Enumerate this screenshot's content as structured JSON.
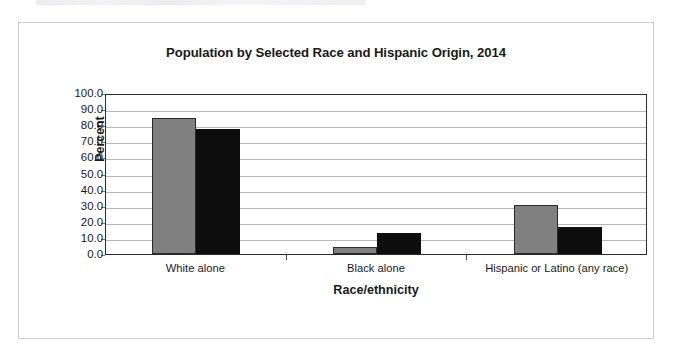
{
  "chart_data": {
    "type": "bar",
    "title": "Population by Selected Race and Hispanic Origin, 2014",
    "xlabel": "Race/ethnicity",
    "ylabel": "Percent",
    "categories": [
      "White alone",
      "Black alone",
      "Hispanic or Latino (any race)"
    ],
    "series": [
      {
        "name": "Arizona",
        "color": "#808080",
        "values": [
          84.5,
          4.5,
          30.5
        ]
      },
      {
        "name": "United States",
        "color": "#0d0d0d",
        "values": [
          77.4,
          13.2,
          17.0
        ]
      }
    ],
    "ylim": [
      0,
      100
    ],
    "ytick_values": [
      0,
      10,
      20,
      30,
      40,
      50,
      60,
      70,
      80,
      90,
      100
    ],
    "ytick_labels": [
      "0.0",
      "10.0",
      "20.0",
      "30.0",
      "40.0",
      "50.0",
      "60.0",
      "70.0",
      "80.0",
      "90.0",
      "100.0"
    ],
    "grid": true,
    "legend_position": "bottom-center"
  },
  "colors": {
    "arizona": "#808080",
    "united_states": "#0d0d0d",
    "axis": "#2b2b2b",
    "gridline": "#b9b9b9",
    "card_border": "#d2d2d2",
    "background": "#ffffff"
  }
}
